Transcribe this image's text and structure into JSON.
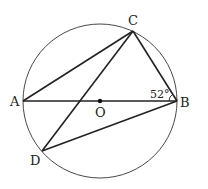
{
  "diagram": {
    "type": "geometry",
    "points": {
      "A": {
        "label": "A",
        "x": 23,
        "y": 101
      },
      "B": {
        "label": "B",
        "x": 177,
        "y": 101
      },
      "C": {
        "label": "C",
        "x": 133,
        "y": 31
      },
      "D": {
        "label": "D",
        "x": 42,
        "y": 151
      },
      "O": {
        "label": "O",
        "x": 100,
        "y": 101
      }
    },
    "circle": {
      "center": "O",
      "cx": 100,
      "cy": 101,
      "r": 77
    },
    "segments": [
      "AB",
      "AC",
      "BC",
      "CD",
      "BD"
    ],
    "angle": {
      "vertex": "B",
      "between": [
        "BA",
        "BC"
      ],
      "value": "52°"
    }
  }
}
